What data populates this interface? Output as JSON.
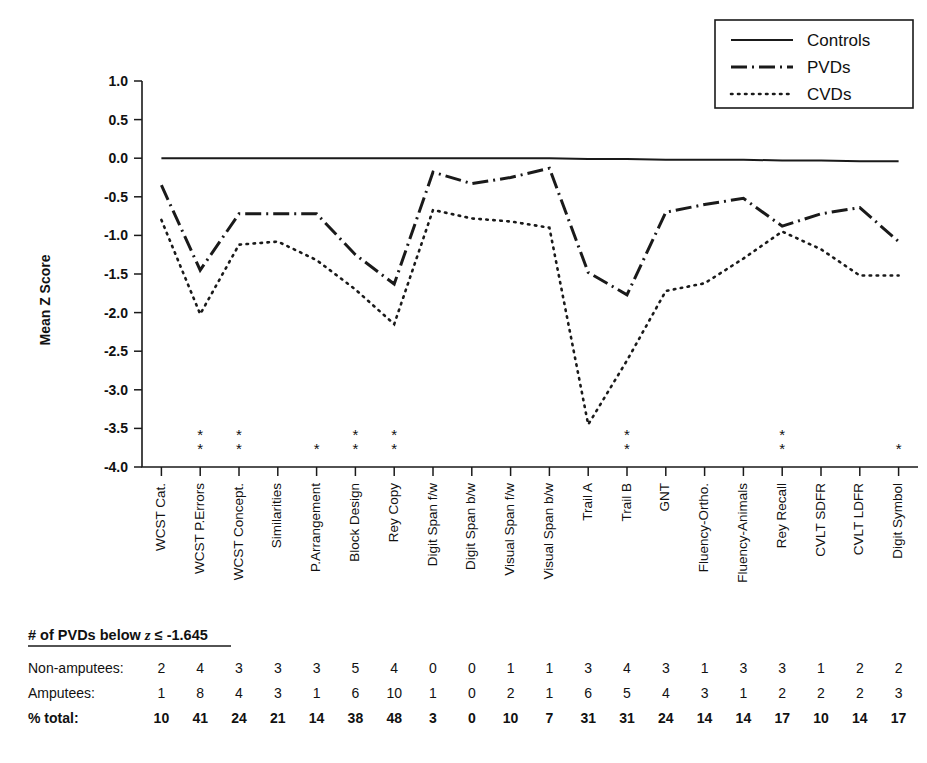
{
  "chart_data": {
    "type": "line",
    "title": "",
    "xlabel": "",
    "ylabel": "Mean Z Score",
    "ylim": [
      -4.0,
      1.0
    ],
    "ytick_labels": [
      "1.0",
      "0.5",
      "0.0",
      "-0.5",
      "-1.0",
      "-1.5",
      "-2.0",
      "-2.5",
      "-3.0",
      "-3.5",
      "-4.0"
    ],
    "ytick_values": [
      1.0,
      0.5,
      0.0,
      -0.5,
      -1.0,
      -1.5,
      -2.0,
      -2.5,
      -3.0,
      -3.5,
      -4.0
    ],
    "grid": false,
    "legend_position": "top-right",
    "categories": [
      "WCST Cat.",
      "WCST P.Errors",
      "WCST Concept.",
      "Similarities",
      "P.Arrangement",
      "Block Design",
      "Rey Copy",
      "Digit Span f/w",
      "Digit Span b/w",
      "Visual Span f/w",
      "Visual Span b/w",
      "Trail A",
      "Trail B",
      "GNT",
      "Fluency-Ortho.",
      "Fluency-Animals",
      "Rey Recall",
      "CVLT SDFR",
      "CVLT LDFR",
      "Digit Symbol"
    ],
    "series": [
      {
        "name": "Controls",
        "style": "solid",
        "values": [
          0.0,
          0.0,
          0.0,
          0.0,
          0.0,
          0.0,
          0.0,
          0.0,
          0.0,
          0.0,
          0.0,
          -0.01,
          -0.01,
          -0.02,
          -0.02,
          -0.02,
          -0.03,
          -0.03,
          -0.04,
          -0.04
        ]
      },
      {
        "name": "PVDs",
        "style": "dash-dot",
        "values": [
          -0.35,
          -1.45,
          -0.72,
          -0.72,
          -0.72,
          -1.25,
          -1.63,
          -0.18,
          -0.33,
          -0.25,
          -0.13,
          -1.48,
          -1.77,
          -0.7,
          -0.6,
          -0.52,
          -0.88,
          -0.72,
          -0.64,
          -1.08
        ]
      },
      {
        "name": "CVDs",
        "style": "dotted",
        "values": [
          -0.8,
          -2.02,
          -1.12,
          -1.08,
          -1.32,
          -1.7,
          -2.15,
          -0.67,
          -0.78,
          -0.82,
          -0.9,
          -3.45,
          -2.62,
          -1.72,
          -1.62,
          -1.3,
          -0.95,
          -1.18,
          -1.52,
          -1.52
        ]
      }
    ],
    "significance_markers": {
      "WCST P.Errors": 2,
      "WCST Concept.": 2,
      "P.Arrangement": 1,
      "Block Design": 2,
      "Rey Copy": 2,
      "Trail B": 2,
      "Rey Recall": 2,
      "Digit Symbol": 1
    },
    "marker_symbol": "*"
  },
  "legend": {
    "entries": [
      {
        "label": "Controls",
        "style": "solid"
      },
      {
        "label": "PVDs",
        "style": "dash-dot"
      },
      {
        "label": "CVDs",
        "style": "dotted"
      }
    ]
  },
  "table": {
    "header_prefix": "# of PVDs below ",
    "header_italic": "z",
    "header_suffix": " ≤ -1.645",
    "rows": [
      {
        "label": "Non-amputees:",
        "bold": false,
        "values": [
          "2",
          "4",
          "3",
          "3",
          "3",
          "5",
          "4",
          "0",
          "0",
          "1",
          "1",
          "3",
          "4",
          "3",
          "1",
          "3",
          "3",
          "1",
          "2",
          "2"
        ]
      },
      {
        "label": "Amputees:",
        "bold": false,
        "values": [
          "1",
          "8",
          "4",
          "3",
          "1",
          "6",
          "10",
          "1",
          "0",
          "2",
          "1",
          "6",
          "5",
          "4",
          "3",
          "1",
          "2",
          "2",
          "2",
          "3"
        ]
      },
      {
        "label": "% total:",
        "bold": true,
        "values": [
          "10",
          "41",
          "24",
          "21",
          "14",
          "38",
          "48",
          "3",
          "0",
          "10",
          "7",
          "31",
          "31",
          "24",
          "14",
          "14",
          "17",
          "10",
          "14",
          "17"
        ]
      }
    ]
  },
  "colors": {
    "ink": "#1a1a1a",
    "background": "#ffffff"
  }
}
